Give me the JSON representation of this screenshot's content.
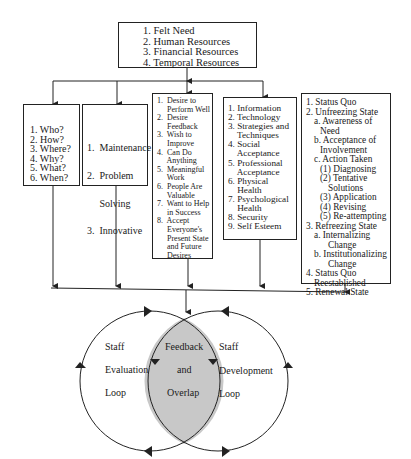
{
  "top_box": {
    "items": [
      "1.  Felt Need",
      "2.  Human Resources",
      "3.  Financial Resources",
      "4.  Temporal Resources"
    ]
  },
  "box_questions": {
    "items": [
      "1.  Who?",
      "2.  How?",
      "3.  Where?",
      "4.  Why?",
      "5.  What?",
      "6.  When?"
    ]
  },
  "box_types": {
    "items": [
      "1.  Maintenance",
      "2.  Problem",
      "     Solving",
      "3.  Innovative"
    ]
  },
  "box_motivation": {
    "items": [
      "1.  Desire to",
      "     Perform Well",
      "2.  Desire",
      "     Feedback",
      "3.  Wish to",
      "     Improve",
      "4.  Can Do",
      "     Anything",
      "5.  Meaningful",
      "     Work",
      "6.  People Are",
      "     Valuable",
      "7.  Want to Help",
      "     in Success",
      "8.  Accept",
      "     Everyone's",
      "     Present State",
      "     and Future",
      "     Desires"
    ]
  },
  "box_needs": {
    "items": [
      "1. Information",
      "2. Technology",
      "3. Strategies and",
      "    Techniques",
      "4. Social",
      "    Acceptance",
      "5. Professional",
      "    Acceptance",
      "6. Physical",
      "    Health",
      "7. Psychological",
      "    Health",
      "8. Security",
      "9. Self Esteem"
    ]
  },
  "box_change": {
    "items": [
      {
        "text": "1. Status Quo",
        "level": 0
      },
      {
        "text": "2. Unfreezing State",
        "level": 0
      },
      {
        "text": "a. Awareness of",
        "level": 1
      },
      {
        "text": "Need",
        "level": 2
      },
      {
        "text": "b. Acceptance of",
        "level": 1
      },
      {
        "text": "Involvement",
        "level": 2
      },
      {
        "text": "c. Action Taken",
        "level": 1
      },
      {
        "text": "(1) Diagnosing",
        "level": 2
      },
      {
        "text": "(2) Tentative",
        "level": 2
      },
      {
        "text": "Solutions",
        "level": 3
      },
      {
        "text": "(3) Application",
        "level": 2
      },
      {
        "text": "(4) Revising",
        "level": 2
      },
      {
        "text": "(5) Re-attempting",
        "level": 2
      },
      {
        "text": "3. Refreezing State",
        "level": 0
      },
      {
        "text": "a. Internalizing",
        "level": 1
      },
      {
        "text": "Change",
        "level": 3
      },
      {
        "text": "b. Institutionalizing",
        "level": 1
      },
      {
        "text": "Change",
        "level": 3
      },
      {
        "text": "4. Status Quo",
        "level": 0
      },
      {
        "text": "Reestablished",
        "level": 1
      },
      {
        "text": "5. Renewal State",
        "level": 0
      }
    ]
  },
  "loops": {
    "left": [
      "Staff",
      "Evaluation",
      "Loop"
    ],
    "center": [
      "Feedback",
      "and",
      "Overlap"
    ],
    "right": [
      "Staff",
      "Development",
      "Loop"
    ]
  },
  "colors": {
    "line": "#222222",
    "overlap_fill": "#c8c8c8"
  }
}
